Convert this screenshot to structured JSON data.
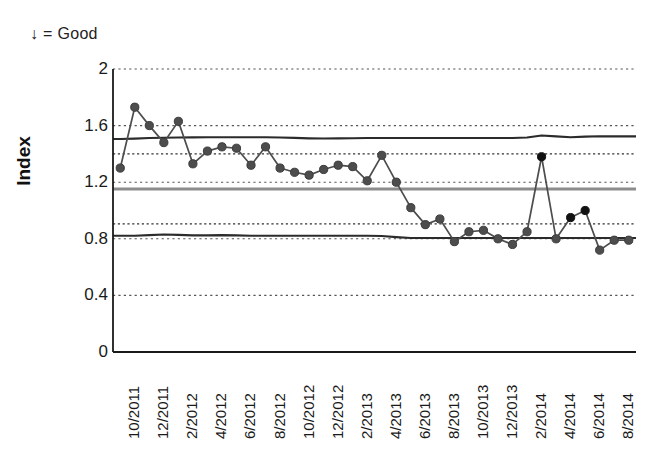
{
  "annotation": {
    "good_note": "↓ = Good"
  },
  "chart_data": {
    "type": "line",
    "title": "",
    "subtitle": "",
    "xlabel": "",
    "ylabel": "Index",
    "ylim": [
      0,
      2
    ],
    "yticks": [
      0,
      0.4,
      0.8,
      1.2,
      1.6,
      2
    ],
    "ytick_labels": [
      "0",
      "0.4",
      "0.8",
      "1.2",
      "1.6",
      "2"
    ],
    "grid": "horizontal-dotted",
    "legend": "none",
    "x_axis_type": "monthly",
    "x_start": "10/2011",
    "x_end": "9/2014",
    "xtick_labels": [
      "10/2011",
      "12/2011",
      "2/2012",
      "4/2012",
      "6/2012",
      "8/2012",
      "10/2012",
      "12/2012",
      "2/2013",
      "4/2013",
      "6/2013",
      "8/2013",
      "10/2013",
      "12/2013",
      "2/2014",
      "4/2014",
      "6/2014",
      "8/2014"
    ],
    "xtick_every_n_months": 2,
    "series": [
      {
        "name": "Index",
        "marker": "circle",
        "color": "#4d4d4d",
        "x": [
          "10/2011",
          "11/2011",
          "12/2011",
          "1/2012",
          "2/2012",
          "3/2012",
          "4/2012",
          "5/2012",
          "6/2012",
          "7/2012",
          "8/2012",
          "9/2012",
          "10/2012",
          "11/2012",
          "12/2012",
          "1/2013",
          "2/2013",
          "3/2013",
          "4/2013",
          "5/2013",
          "6/2013",
          "7/2013",
          "8/2013",
          "9/2013",
          "10/2013",
          "11/2013",
          "12/2013",
          "1/2014",
          "2/2014",
          "3/2014",
          "4/2014",
          "5/2014",
          "6/2014",
          "7/2014",
          "8/2014",
          "9/2014"
        ],
        "values": [
          1.3,
          1.73,
          1.6,
          1.48,
          1.63,
          1.33,
          1.42,
          1.45,
          1.44,
          1.32,
          1.45,
          1.3,
          1.27,
          1.25,
          1.29,
          1.32,
          1.31,
          1.21,
          1.39,
          1.2,
          1.02,
          0.9,
          0.94,
          0.78,
          0.85,
          0.86,
          0.8,
          0.76,
          0.85,
          1.38,
          0.8,
          0.95,
          1.0,
          0.72,
          0.79,
          0.79
        ],
        "highlight_color": "#111111",
        "highlight_points": [
          "3/2014",
          "5/2014",
          "6/2014"
        ]
      },
      {
        "name": "Upper control limit",
        "style": "solid-dark",
        "color": "#2b2b2b",
        "values": [
          1.505,
          1.508,
          1.512,
          1.514,
          1.516,
          1.517,
          1.518,
          1.518,
          1.518,
          1.518,
          1.518,
          1.516,
          1.513,
          1.51,
          1.509,
          1.51,
          1.511,
          1.512,
          1.512,
          1.512,
          1.512,
          1.512,
          1.512,
          1.512,
          1.512,
          1.512,
          1.512,
          1.512,
          1.516,
          1.53,
          1.524,
          1.518,
          1.522,
          1.525,
          1.524,
          1.524
        ]
      },
      {
        "name": "Center line",
        "style": "solid-gray",
        "color": "#8c8c8c",
        "values": [
          1.152,
          1.152,
          1.152,
          1.152,
          1.152,
          1.152,
          1.152,
          1.152,
          1.152,
          1.152,
          1.152,
          1.152,
          1.152,
          1.152,
          1.152,
          1.152,
          1.152,
          1.152,
          1.152,
          1.152,
          1.152,
          1.152,
          1.152,
          1.152,
          1.152,
          1.152,
          1.152,
          1.152,
          1.152,
          1.152,
          1.152,
          1.152,
          1.152,
          1.152,
          1.152,
          1.152
        ]
      },
      {
        "name": "Lower control limit",
        "style": "solid-dark",
        "color": "#2b2b2b",
        "values": [
          0.822,
          0.822,
          0.826,
          0.83,
          0.828,
          0.824,
          0.824,
          0.826,
          0.824,
          0.822,
          0.822,
          0.822,
          0.822,
          0.822,
          0.822,
          0.822,
          0.822,
          0.822,
          0.82,
          0.812,
          0.806,
          0.806,
          0.806,
          0.806,
          0.806,
          0.806,
          0.806,
          0.806,
          0.806,
          0.806,
          0.806,
          0.806,
          0.806,
          0.806,
          0.806,
          0.806
        ]
      },
      {
        "name": "Upper warning band",
        "style": "dashed-dark",
        "color": "#333333",
        "values": [
          1.4,
          1.4,
          1.4,
          1.4,
          1.4,
          1.4,
          1.4,
          1.4,
          1.4,
          1.4,
          1.4,
          1.4,
          1.4,
          1.4,
          1.4,
          1.4,
          1.4,
          1.4,
          1.4,
          1.4,
          1.4,
          1.4,
          1.4,
          1.4,
          1.4,
          1.4,
          1.4,
          1.4,
          1.4,
          1.4,
          1.4,
          1.4,
          1.4,
          1.4,
          1.4,
          1.4
        ]
      },
      {
        "name": "Lower warning band",
        "style": "dashed-dark",
        "color": "#333333",
        "values": [
          0.905,
          0.905,
          0.905,
          0.905,
          0.905,
          0.905,
          0.905,
          0.905,
          0.905,
          0.905,
          0.905,
          0.905,
          0.905,
          0.905,
          0.905,
          0.905,
          0.905,
          0.905,
          0.905,
          0.905,
          0.905,
          0.905,
          0.905,
          0.905,
          0.905,
          0.905,
          0.905,
          0.905,
          0.905,
          0.905,
          0.905,
          0.905,
          0.905,
          0.905,
          0.905,
          0.905
        ]
      }
    ]
  }
}
